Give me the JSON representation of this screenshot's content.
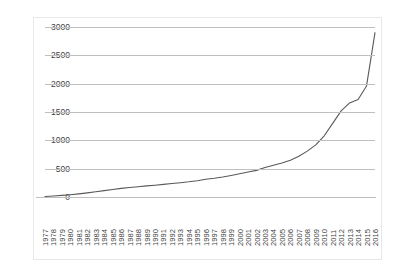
{
  "top_caption": "",
  "chart_data": {
    "type": "line",
    "title": "",
    "subtitle": "",
    "xlabel": "",
    "ylabel": "",
    "xlim": [
      1977,
      2016
    ],
    "ylim": [
      0,
      3000
    ],
    "ytick_step": 500,
    "grid": true,
    "legend": false,
    "legend_position": "none",
    "line_color": "#595959",
    "gridline_color": "#bfbfbf",
    "marker": "none",
    "yticks": [
      0,
      500,
      1000,
      1500,
      2000,
      2500,
      3000
    ],
    "ytick_labels": [
      "0",
      "500",
      "1000",
      "1500",
      "2000",
      "2500",
      "3000"
    ],
    "categories": [
      "1977",
      "1978",
      "1979",
      "1980",
      "1981",
      "1982",
      "1983",
      "1984",
      "1985",
      "1986",
      "1987",
      "1988",
      "1989",
      "1990",
      "1991",
      "1992",
      "1993",
      "1994",
      "1995",
      "1996",
      "1997",
      "1998",
      "1999",
      "2000",
      "2001",
      "2002",
      "2003",
      "2004",
      "2005",
      "2006",
      "2007",
      "2008",
      "2009",
      "2010",
      "2011",
      "2012",
      "2013",
      "2014",
      "2015",
      "2016"
    ],
    "series": [
      {
        "name": "value",
        "values": [
          10,
          18,
          28,
          40,
          55,
          72,
          92,
          112,
          132,
          152,
          168,
          182,
          196,
          208,
          222,
          238,
          252,
          268,
          288,
          312,
          330,
          352,
          380,
          410,
          440,
          470,
          520,
          560,
          600,
          650,
          720,
          810,
          920,
          1080,
          1300,
          1520,
          1660,
          1720,
          1960,
          2280
        ]
      }
    ],
    "values": [
      10,
      18,
      28,
      40,
      55,
      72,
      92,
      112,
      132,
      152,
      168,
      182,
      196,
      208,
      222,
      238,
      252,
      268,
      288,
      312,
      330,
      352,
      380,
      410,
      440,
      470,
      520,
      560,
      600,
      650,
      720,
      810,
      920,
      1080,
      1300,
      1520,
      1660,
      1720,
      1960,
      2280
    ],
    "final_value": 2900,
    "annotations": []
  }
}
